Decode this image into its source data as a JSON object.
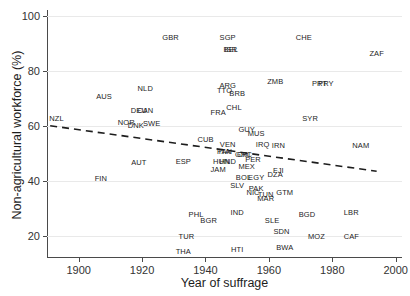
{
  "chart_data": {
    "type": "scatter",
    "title": "",
    "xlabel": "Year of suffrage",
    "ylabel": "Non-agricultural workforce (%)",
    "xlim": [
      1890,
      2002
    ],
    "ylim": [
      12,
      102
    ],
    "xticks": [
      1900,
      1920,
      1940,
      1960,
      1980,
      2000
    ],
    "yticks": [
      20,
      40,
      60,
      80,
      100
    ],
    "grid": true,
    "legend": "none",
    "point_marker": "text-label",
    "trend_line": {
      "style": "dashed",
      "color": "#1d1d1d",
      "x_start": 1891,
      "y_start": 60.0,
      "x_end": 1994,
      "y_end": 43.5
    },
    "points": [
      {
        "label": "NZL",
        "x": 1893,
        "y": 62.5
      },
      {
        "label": "AUS",
        "x": 1908,
        "y": 70.5
      },
      {
        "label": "FIN",
        "x": 1907,
        "y": 40.5
      },
      {
        "label": "NOR",
        "x": 1915,
        "y": 61.0
      },
      {
        "label": "DNK",
        "x": 1918,
        "y": 60.0
      },
      {
        "label": "DEU",
        "x": 1919,
        "y": 65.5
      },
      {
        "label": "CAN",
        "x": 1921,
        "y": 65.5
      },
      {
        "label": "SWE",
        "x": 1923,
        "y": 60.5
      },
      {
        "label": "NLD",
        "x": 1921,
        "y": 73.5
      },
      {
        "label": "AUT",
        "x": 1919,
        "y": 46.5
      },
      {
        "label": "GBR",
        "x": 1929,
        "y": 92.0
      },
      {
        "label": "TUR",
        "x": 1934,
        "y": 19.5
      },
      {
        "label": "THA",
        "x": 1933,
        "y": 14.0
      },
      {
        "label": "ESP",
        "x": 1933,
        "y": 47.0
      },
      {
        "label": "CUB",
        "x": 1940,
        "y": 55.0
      },
      {
        "label": "PHL",
        "x": 1937,
        "y": 27.5
      },
      {
        "label": "BGR",
        "x": 1941,
        "y": 25.5
      },
      {
        "label": "FRA",
        "x": 1944,
        "y": 64.5
      },
      {
        "label": "TTO",
        "x": 1946,
        "y": 72.5
      },
      {
        "label": "ARG",
        "x": 1947,
        "y": 74.5
      },
      {
        "label": "BRB",
        "x": 1950,
        "y": 71.5
      },
      {
        "label": "SGP",
        "x": 1947,
        "y": 92.0
      },
      {
        "label": "BEL",
        "x": 1948,
        "y": 87.5
      },
      {
        "label": "ISR",
        "x": 1948,
        "y": 87.5
      },
      {
        "label": "IND",
        "x": 1950,
        "y": 28.5
      },
      {
        "label": "JAM",
        "x": 1944,
        "y": 44.0
      },
      {
        "label": "ITA",
        "x": 1946,
        "y": 50.5
      },
      {
        "label": "PAN",
        "x": 1946,
        "y": 50.5
      },
      {
        "label": "HUN",
        "x": 1945,
        "y": 47.0
      },
      {
        "label": "HND",
        "x": 1947,
        "y": 47.0
      },
      {
        "label": "VEN",
        "x": 1947,
        "y": 53.0
      },
      {
        "label": "CHL",
        "x": 1949,
        "y": 66.5
      },
      {
        "label": "GUY",
        "x": 1953,
        "y": 58.5
      },
      {
        "label": "CRI",
        "x": 1952,
        "y": 49.5
      },
      {
        "label": "GRC",
        "x": 1952,
        "y": 49.5
      },
      {
        "label": "SLV",
        "x": 1950,
        "y": 38.0
      },
      {
        "label": "BOL",
        "x": 1952,
        "y": 41.0
      },
      {
        "label": "EGY",
        "x": 1956,
        "y": 41.0
      },
      {
        "label": "MEX",
        "x": 1953,
        "y": 45.0
      },
      {
        "label": "PER",
        "x": 1955,
        "y": 47.5
      },
      {
        "label": "HTI",
        "x": 1950,
        "y": 15.0
      },
      {
        "label": "NIC",
        "x": 1955,
        "y": 35.5
      },
      {
        "label": "PAK",
        "x": 1956,
        "y": 37.0
      },
      {
        "label": "MUS",
        "x": 1956,
        "y": 57.0
      },
      {
        "label": "IRQ",
        "x": 1958,
        "y": 53.0
      },
      {
        "label": "MAR",
        "x": 1959,
        "y": 33.5
      },
      {
        "label": "TUN",
        "x": 1959,
        "y": 35.0
      },
      {
        "label": "ZMB",
        "x": 1962,
        "y": 76.0
      },
      {
        "label": "SLE",
        "x": 1961,
        "y": 25.5
      },
      {
        "label": "SDN",
        "x": 1964,
        "y": 21.5
      },
      {
        "label": "IRN",
        "x": 1963,
        "y": 52.5
      },
      {
        "label": "FJI",
        "x": 1963,
        "y": 43.5
      },
      {
        "label": "DZA",
        "x": 1962,
        "y": 42.0
      },
      {
        "label": "GTM",
        "x": 1965,
        "y": 35.5
      },
      {
        "label": "BWA",
        "x": 1965,
        "y": 15.5
      },
      {
        "label": "CHE",
        "x": 1971,
        "y": 92.0
      },
      {
        "label": "SYR",
        "x": 1973,
        "y": 62.5
      },
      {
        "label": "BGD",
        "x": 1972,
        "y": 27.5
      },
      {
        "label": "PRY",
        "x": 1978,
        "y": 75.0
      },
      {
        "label": "PRT",
        "x": 1976,
        "y": 75.0
      },
      {
        "label": "MOZ",
        "x": 1975,
        "y": 19.5
      },
      {
        "label": "NAM",
        "x": 1989,
        "y": 52.5
      },
      {
        "label": "LBR",
        "x": 1986,
        "y": 28.5
      },
      {
        "label": "CAF",
        "x": 1986,
        "y": 19.5
      },
      {
        "label": "ZAF",
        "x": 1994,
        "y": 86.0
      }
    ]
  }
}
